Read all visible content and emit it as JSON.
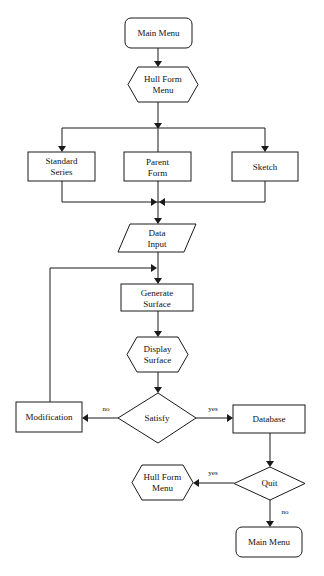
{
  "diagram": {
    "type": "flowchart",
    "nodes": [
      {
        "id": "main_menu_top",
        "shape": "rounded-rect",
        "lines": [
          "Main Menu"
        ]
      },
      {
        "id": "hull_form_menu_top",
        "shape": "hexagon",
        "lines": [
          "Hull Form",
          "Menu"
        ]
      },
      {
        "id": "standard_series",
        "shape": "rect",
        "lines": [
          "Standard",
          "Series"
        ]
      },
      {
        "id": "parent_form",
        "shape": "rect",
        "lines": [
          "Parent",
          "Form"
        ]
      },
      {
        "id": "sketch",
        "shape": "rect",
        "lines": [
          "Sketch"
        ]
      },
      {
        "id": "data_input",
        "shape": "parallelogram",
        "lines": [
          "Data",
          "Input"
        ]
      },
      {
        "id": "generate_surface",
        "shape": "rect",
        "lines": [
          "Generate",
          "Surface"
        ]
      },
      {
        "id": "display_surface",
        "shape": "hexagon",
        "lines": [
          "Display",
          "Surface"
        ]
      },
      {
        "id": "satisfy",
        "shape": "diamond",
        "lines": [
          "Satisfy"
        ]
      },
      {
        "id": "modification",
        "shape": "rect",
        "lines": [
          "Modification"
        ]
      },
      {
        "id": "database",
        "shape": "rect",
        "lines": [
          "Database"
        ]
      },
      {
        "id": "quit",
        "shape": "diamond",
        "lines": [
          "Quit"
        ]
      },
      {
        "id": "hull_form_menu_bottom",
        "shape": "hexagon",
        "lines": [
          "Hull Form",
          "Menu"
        ]
      },
      {
        "id": "main_menu_bottom",
        "shape": "rounded-rect",
        "lines": [
          "Main Menu"
        ]
      }
    ],
    "edges": [
      {
        "from": "main_menu_top",
        "to": "hull_form_menu_top",
        "label": ""
      },
      {
        "from": "hull_form_menu_top",
        "to": "standard_series",
        "label": ""
      },
      {
        "from": "hull_form_menu_top",
        "to": "parent_form",
        "label": ""
      },
      {
        "from": "hull_form_menu_top",
        "to": "sketch",
        "label": ""
      },
      {
        "from": "standard_series",
        "to": "data_input",
        "label": ""
      },
      {
        "from": "parent_form",
        "to": "data_input",
        "label": ""
      },
      {
        "from": "sketch",
        "to": "data_input",
        "label": ""
      },
      {
        "from": "data_input",
        "to": "generate_surface",
        "label": ""
      },
      {
        "from": "generate_surface",
        "to": "display_surface",
        "label": ""
      },
      {
        "from": "display_surface",
        "to": "satisfy",
        "label": ""
      },
      {
        "from": "satisfy",
        "to": "modification",
        "label": "no"
      },
      {
        "from": "satisfy",
        "to": "database",
        "label": "yes"
      },
      {
        "from": "modification",
        "to": "generate_surface",
        "label": ""
      },
      {
        "from": "database",
        "to": "quit",
        "label": ""
      },
      {
        "from": "quit",
        "to": "hull_form_menu_bottom",
        "label": "yes"
      },
      {
        "from": "quit",
        "to": "main_menu_bottom",
        "label": "no"
      }
    ]
  }
}
